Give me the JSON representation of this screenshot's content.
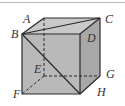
{
  "diagram": {
    "type": "cube",
    "labels": {
      "A": "A",
      "B": "B",
      "C": "C",
      "D": "D",
      "E": "E",
      "F": "F",
      "G": "G",
      "H": "H"
    },
    "colors": {
      "front_face": "#b8b8b8",
      "top_face": "#c8c8c8",
      "right_face": "#a9a9a9",
      "edge": "#2a2a2a",
      "border": "#b8b8b8"
    }
  }
}
